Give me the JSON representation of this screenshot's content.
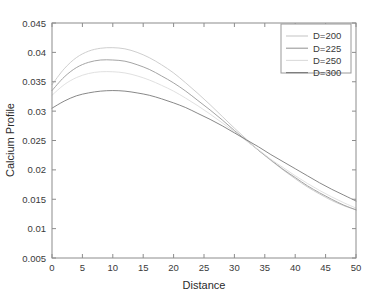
{
  "chart_data": {
    "type": "line",
    "title": "",
    "xlabel": "Distance",
    "ylabel": "Calcium Profile",
    "xlim": [
      0,
      50
    ],
    "ylim": [
      0.005,
      0.045
    ],
    "xticks": [
      0,
      5,
      10,
      15,
      20,
      25,
      30,
      35,
      40,
      45,
      50
    ],
    "xtick_labels": [
      "0",
      "5",
      "10",
      "15",
      "20",
      "25",
      "30",
      "35",
      "40",
      "45",
      "50"
    ],
    "yticks": [
      0.005,
      0.01,
      0.015,
      0.02,
      0.025,
      0.03,
      0.035,
      0.04,
      0.045
    ],
    "ytick_labels": [
      "0.005",
      "0.01",
      "0.015",
      "0.02",
      "0.025",
      "0.03",
      "0.035",
      "0.04",
      "0.045"
    ],
    "grid": false,
    "box": true,
    "legend_position": "upper-right",
    "x": [
      0,
      2,
      4,
      6,
      8,
      10,
      12,
      14,
      16,
      18,
      20,
      22,
      24,
      26,
      28,
      30,
      32,
      34,
      36,
      38,
      40,
      42,
      44,
      46,
      48,
      50
    ],
    "series": [
      {
        "name": "D=200",
        "color": "#c8c8c8",
        "values": [
          0.0345,
          0.0372,
          0.0391,
          0.0402,
          0.0407,
          0.0408,
          0.0406,
          0.04,
          0.0391,
          0.0379,
          0.0365,
          0.0348,
          0.033,
          0.0311,
          0.0291,
          0.0271,
          0.0252,
          0.0233,
          0.0216,
          0.02,
          0.0185,
          0.0171,
          0.0159,
          0.0148,
          0.0139,
          0.0132
        ]
      },
      {
        "name": "D=225",
        "color": "#9a9a9a",
        "values": [
          0.0335,
          0.0358,
          0.0374,
          0.0383,
          0.0387,
          0.0387,
          0.0385,
          0.0379,
          0.0371,
          0.036,
          0.0348,
          0.0334,
          0.0318,
          0.0302,
          0.0285,
          0.0267,
          0.025,
          0.0233,
          0.0217,
          0.0201,
          0.0187,
          0.0173,
          0.0161,
          0.015,
          0.014,
          0.0132
        ]
      },
      {
        "name": "D=250",
        "color": "#dcdcdc",
        "values": [
          0.0327,
          0.0345,
          0.0357,
          0.0364,
          0.0367,
          0.0367,
          0.0365,
          0.036,
          0.0353,
          0.0344,
          0.0334,
          0.0322,
          0.0309,
          0.0295,
          0.028,
          0.0265,
          0.0249,
          0.0234,
          0.0218,
          0.0204,
          0.019,
          0.0177,
          0.0165,
          0.0154,
          0.0144,
          0.0135
        ]
      },
      {
        "name": "D=300",
        "color": "#7a7a7a",
        "values": [
          0.0305,
          0.0317,
          0.0326,
          0.0331,
          0.0334,
          0.0335,
          0.0334,
          0.0331,
          0.0327,
          0.0321,
          0.0314,
          0.0306,
          0.0296,
          0.0286,
          0.0275,
          0.0263,
          0.0251,
          0.0239,
          0.0226,
          0.0214,
          0.0202,
          0.019,
          0.0178,
          0.0167,
          0.0157,
          0.0147
        ]
      }
    ]
  },
  "axes": {
    "xlabel": "Distance",
    "ylabel": "Calcium Profile"
  },
  "legend": {
    "items": [
      {
        "label": "D=200"
      },
      {
        "label": "D=225"
      },
      {
        "label": "D=250"
      },
      {
        "label": "D=300"
      }
    ]
  }
}
